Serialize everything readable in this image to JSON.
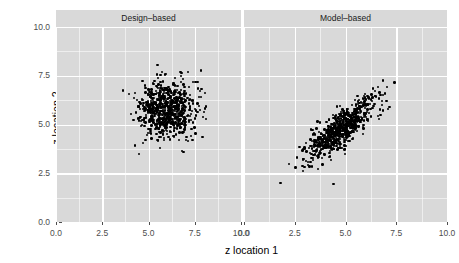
{
  "chart_data": {
    "type": "scatter",
    "title": "",
    "xlabel": "z location 1",
    "ylabel": "z location 2",
    "xlim": [
      0.0,
      10.0
    ],
    "ylim": [
      0.0,
      10.0
    ],
    "x_ticks": [
      "0.0",
      "2.5",
      "5.0",
      "7.5",
      "10.0"
    ],
    "y_ticks": [
      "0.0",
      "2.5",
      "5.0",
      "7.5",
      "10.0"
    ],
    "x_tick_values": [
      0.0,
      2.5,
      5.0,
      7.5,
      10.0
    ],
    "y_tick_values": [
      0.0,
      2.5,
      5.0,
      7.5,
      10.0
    ],
    "grid": true,
    "legend": "none",
    "facet_layout": "1 row x 2 columns",
    "panels": [
      {
        "label": "Design–based",
        "n_points": 700,
        "center": [
          5.95,
          5.75
        ],
        "sd_x": 0.78,
        "sd_y": 0.72,
        "correlation": 0.05,
        "x_range": [
          3.8,
          8.1
        ],
        "y_range": [
          3.7,
          8.1
        ],
        "shape": "circular cloud",
        "point_color": "#000000"
      },
      {
        "label": "Model–based",
        "n_points": 700,
        "center": [
          4.85,
          4.85
        ],
        "sd_x": 0.85,
        "sd_y": 0.82,
        "correlation": 0.82,
        "x_range": [
          2.5,
          8.2
        ],
        "y_range": [
          1.9,
          7.9
        ],
        "shape": "elongated positively correlated cloud",
        "point_color": "#000000",
        "outliers": [
          {
            "x": 1.8,
            "y": 2.0
          },
          {
            "x": 4.4,
            "y": 1.95
          }
        ]
      }
    ],
    "style": {
      "panel_background": "#d9d9d9",
      "strip_background": "#d9d9d9",
      "grid_color": "#ffffff",
      "plot_background": "#ffffff",
      "axis_text_color": "#4d4d4d",
      "axis_title_color": "#000000"
    }
  }
}
